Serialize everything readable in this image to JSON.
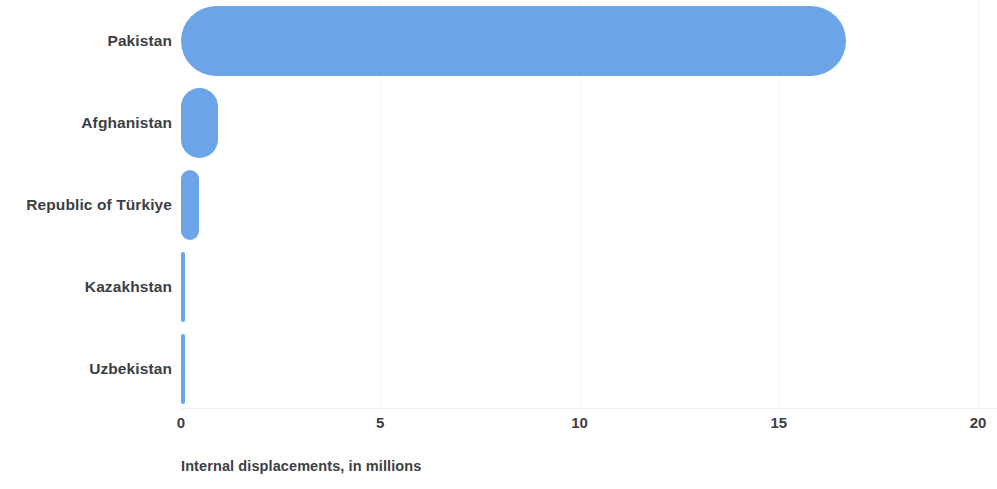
{
  "chart_data": {
    "type": "bar",
    "orientation": "horizontal",
    "title": "",
    "subtitle": "",
    "xlabel": "Internal displacements, in millions",
    "ylabel": "",
    "categories": [
      "Pakistan",
      "Afghanistan",
      "Republic of Türkiye",
      "Kazakhstan",
      "Uzbekistan"
    ],
    "values": [
      16.7,
      0.93,
      0.46,
      0.1,
      0.08
    ],
    "xlim": [
      0,
      20
    ],
    "xticks": [
      0,
      5,
      10,
      15,
      20
    ],
    "xtick_labels": [
      "0",
      "5",
      "10",
      "15",
      "20"
    ],
    "grid": true,
    "grid_axis": "x",
    "legend": null,
    "bar_color": "#6BA5E8",
    "label_color": "#3c4043",
    "gridline_color": "#f4f4f5",
    "background": "#ffffff"
  },
  "axis": {
    "caption": "Internal displacements, in millions"
  }
}
